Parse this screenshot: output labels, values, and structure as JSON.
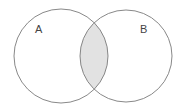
{
  "diagram": {
    "type": "venn",
    "sets": [
      {
        "label": "A",
        "cx": 61,
        "cy": 56,
        "r": 47
      },
      {
        "label": "B",
        "cx": 126,
        "cy": 56,
        "r": 46
      }
    ],
    "highlighted_region": "A ∩ B",
    "colors": {
      "stroke": "#7a7a7a",
      "intersection_fill": "#e2e2e2",
      "background": "#ffffff"
    }
  }
}
